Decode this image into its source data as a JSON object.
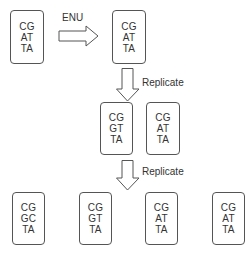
{
  "title": "",
  "generation_0": {
    "original": {
      "lines": [
        "CG",
        "AT",
        "TA"
      ]
    },
    "mutagenized": {
      "lines": [
        "CG",
        "AT",
        "TA"
      ]
    },
    "mutagen_label": "ENU"
  },
  "step_1": {
    "label": "Replicate"
  },
  "generation_1": [
    {
      "lines": [
        "CG",
        "GT",
        "TA"
      ]
    },
    {
      "lines": [
        "CG",
        "AT",
        "TA"
      ]
    }
  ],
  "step_2": {
    "label": "Replicate"
  },
  "generation_2": [
    {
      "lines": [
        "CG",
        "GC",
        "TA"
      ]
    },
    {
      "lines": [
        "CG",
        "GT",
        "TA"
      ]
    },
    {
      "lines": [
        "CG",
        "AT",
        "TA"
      ]
    },
    {
      "lines": [
        "CG",
        "AT",
        "TA"
      ]
    }
  ],
  "colors": {
    "stroke": "#555555",
    "text": "#333333",
    "background": "#ffffff"
  }
}
